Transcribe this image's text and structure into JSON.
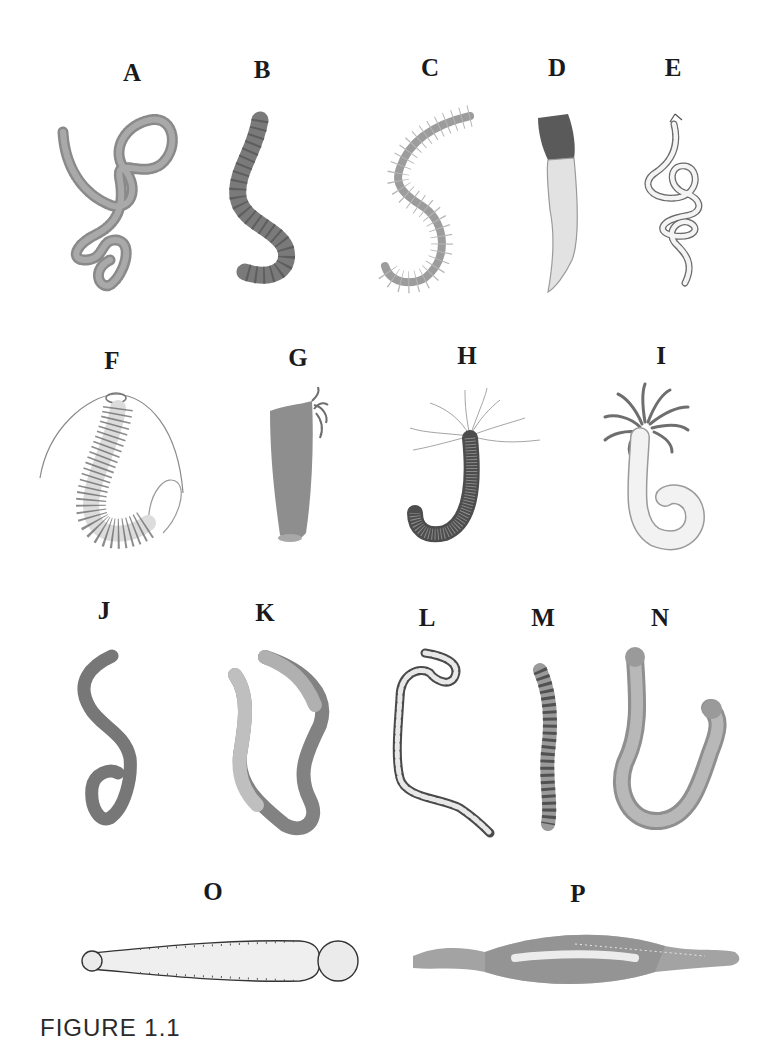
{
  "figure": {
    "caption": "FIGURE 1.1",
    "background": "#ffffff",
    "label_color": "#1a1a1a",
    "panels": [
      {
        "label": "A",
        "row": 1,
        "description": "coiled bristly worm, tangled loops"
      },
      {
        "label": "B",
        "row": 1,
        "description": "segmented worm, hook-shaped"
      },
      {
        "label": "C",
        "row": 1,
        "description": "S-shaped worm with lateral bristles"
      },
      {
        "label": "D",
        "row": 1,
        "description": "tubular worm with dark head cap"
      },
      {
        "label": "E",
        "row": 1,
        "description": "thin beaded coiled worm line drawing"
      },
      {
        "label": "F",
        "row": 2,
        "description": "worm with fringed parapodia and long antennae"
      },
      {
        "label": "G",
        "row": 2,
        "description": "tapered tube with tentacle tuft"
      },
      {
        "label": "H",
        "row": 2,
        "description": "J-shaped worm with branching tentacles"
      },
      {
        "label": "I",
        "row": 2,
        "description": "tube worm with feathery crown"
      },
      {
        "label": "J",
        "row": 3,
        "description": "smooth S-curved worm"
      },
      {
        "label": "K",
        "row": 3,
        "description": "long smooth worm in U-loop"
      },
      {
        "label": "L",
        "row": 3,
        "description": "thin segmented worm with hooked end"
      },
      {
        "label": "M",
        "row": 3,
        "description": "short banded worm"
      },
      {
        "label": "N",
        "row": 3,
        "description": "U-shaped granular worm"
      },
      {
        "label": "O",
        "row": 4,
        "description": "elongated club-shaped worm with knobbed end"
      },
      {
        "label": "P",
        "row": 4,
        "description": "spindle-shaped mottled worm"
      }
    ]
  }
}
